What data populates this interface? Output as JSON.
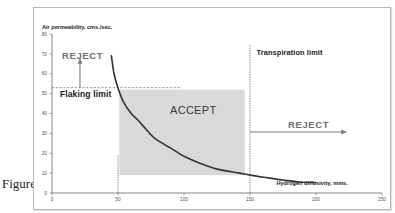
{
  "figure": {
    "caption": "Figure 1"
  },
  "colors": {
    "frame_border": "#b8b8b8",
    "axis": "#666666",
    "curve": "#333333",
    "accept_region": "#d9d9d9",
    "reject_text": "#707070",
    "arrow": "#7a7a7a",
    "label_text": "#1a1a1a",
    "tick_text": "#555555"
  },
  "chart_data": {
    "type": "line",
    "title": "",
    "xlabel": "Hydrogen diffusivity, mms.",
    "ylabel": "Air permeability, cms./sec.",
    "xlim": [
      0,
      250
    ],
    "ylim": [
      0,
      80
    ],
    "xticks": [
      0,
      50,
      100,
      150,
      200,
      250
    ],
    "yticks": [
      0,
      10,
      20,
      30,
      40,
      50,
      60,
      70,
      80
    ],
    "grid": false,
    "legend": null,
    "series": [
      {
        "name": "Air permeability vs hydrogen diffusivity",
        "x": [
          45,
          47,
          50,
          54,
          60,
          65,
          70,
          77,
          85,
          90,
          100,
          112,
          125,
          142,
          150,
          165,
          175,
          188,
          200
        ],
        "y": [
          69,
          60,
          52.8,
          46,
          40,
          36.7,
          33,
          28,
          24.5,
          22.6,
          18.5,
          15,
          12,
          10,
          9,
          7.5,
          6.5,
          5.5,
          5.3
        ]
      }
    ],
    "regions": [
      {
        "name": "accept-region",
        "label": "ACCEPT",
        "x": [
          51,
          146
        ],
        "y": [
          9,
          52
        ]
      }
    ],
    "reference_lines": [
      {
        "name": "flaking-limit-line",
        "orientation": "horizontal",
        "value": 53,
        "from": 0,
        "to": 98,
        "label": "Flaking limit"
      },
      {
        "name": "min-diffusivity-line",
        "orientation": "vertical",
        "value": 50,
        "from": 0,
        "to": 19
      },
      {
        "name": "transpiration-limit-line",
        "orientation": "vertical",
        "value": 150,
        "from": 0,
        "to": 75,
        "label": "Transpiration limit"
      }
    ],
    "annotations": [
      {
        "name": "reject-top-label",
        "text": "REJECT",
        "x": 7.6,
        "y": 69.3,
        "style": "reject"
      },
      {
        "name": "flaking-limit-label",
        "text": "Flaking limit",
        "x": 6,
        "y": 49.7,
        "style": "limit"
      },
      {
        "name": "accept-label",
        "text": "ACCEPT",
        "x": 89.4,
        "y": 41.7,
        "style": "accept"
      },
      {
        "name": "transpiration-limit-label",
        "text": "Transpiration limit",
        "x": 155,
        "y": 70.9,
        "style": "limit-small"
      },
      {
        "name": "reject-right-label",
        "text": "REJECT",
        "x": 178.8,
        "y": 34.2,
        "style": "reject"
      }
    ],
    "arrows": [
      {
        "name": "reject-up-arrow",
        "x1": 21.2,
        "y1": 53,
        "x2": 21.2,
        "y2": 67.5
      },
      {
        "name": "reject-right-arrow",
        "x1": 150,
        "y1": 30.7,
        "x2": 223,
        "y2": 30.7
      }
    ]
  }
}
